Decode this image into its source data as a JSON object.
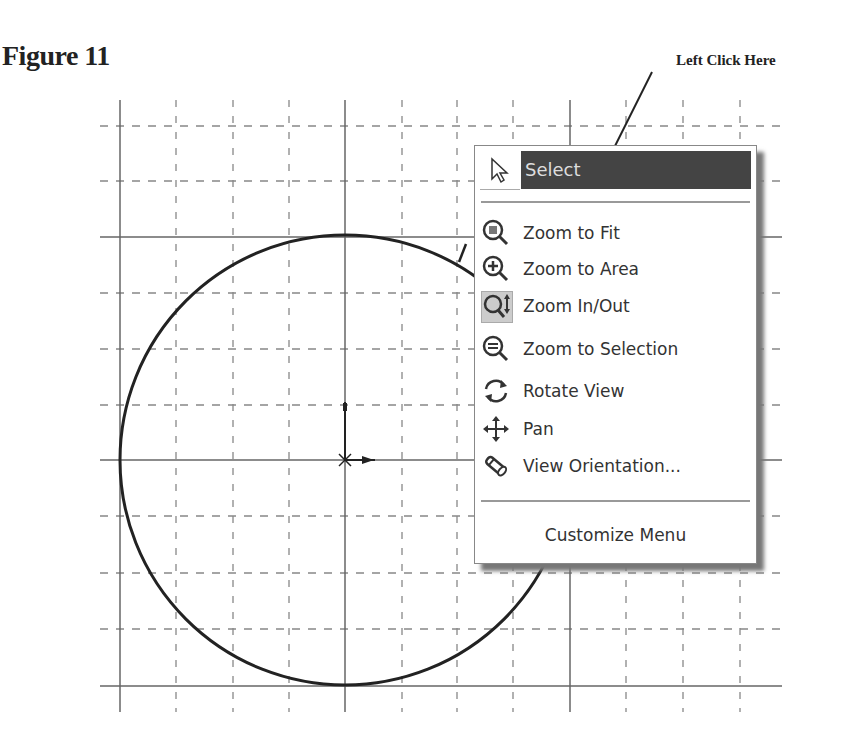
{
  "figure": {
    "title": "Figure 11"
  },
  "callout": {
    "text": "Left Click Here"
  },
  "menu": {
    "select": {
      "label": "Select",
      "icon": "cursor-arrow-icon"
    },
    "items": [
      {
        "label": "Zoom to Fit",
        "icon": "zoom-to-fit-icon"
      },
      {
        "label": "Zoom to Area",
        "icon": "zoom-to-area-icon"
      },
      {
        "label": "Zoom In/Out",
        "icon": "zoom-in-out-icon",
        "active": true
      },
      {
        "label": "Zoom to Selection",
        "icon": "zoom-to-selection-icon"
      },
      {
        "label": "Rotate View",
        "icon": "rotate-view-icon"
      },
      {
        "label": "Pan",
        "icon": "pan-icon"
      },
      {
        "label": "View Orientation...",
        "icon": "view-orientation-icon"
      }
    ],
    "customize": {
      "label": "Customize Menu"
    }
  },
  "sketch": {
    "circle": {
      "cx": 345,
      "cy": 460,
      "r": 225
    },
    "grid": {
      "minor_x": [
        176,
        233,
        289,
        402,
        457,
        513,
        626,
        683,
        740
      ],
      "major_x": [
        120,
        345,
        570
      ],
      "minor_y": [
        126,
        181,
        293,
        349,
        405,
        516,
        573,
        629
      ],
      "major_y": [
        237,
        460,
        686
      ]
    }
  }
}
